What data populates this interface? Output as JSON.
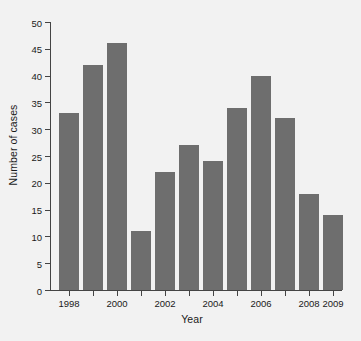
{
  "chart_data": {
    "type": "bar",
    "title": "",
    "xlabel": "Year",
    "ylabel": "Number of cases",
    "categories": [
      "1998",
      "1999",
      "2000",
      "2001",
      "2002",
      "2003",
      "2004",
      "2005",
      "2006",
      "2007",
      "2008",
      "2009"
    ],
    "values": [
      33,
      42,
      46,
      11,
      22,
      27,
      24,
      34,
      40,
      32,
      18,
      14
    ],
    "ylim": [
      0,
      50
    ],
    "yticks": [
      0,
      5,
      10,
      15,
      20,
      25,
      30,
      35,
      40,
      45,
      50
    ],
    "ytick_labels": [
      "0",
      "5",
      "10",
      "15",
      "20",
      "25",
      "30",
      "35",
      "40",
      "45",
      "50"
    ],
    "xtick_labels": [
      "1998",
      "",
      "2000",
      "",
      "2002",
      "",
      "2004",
      "",
      "2006",
      "",
      "2008",
      "2009"
    ],
    "grid": false,
    "legend": null,
    "bar_color": "#6e6e6e",
    "background_color": "#f2f2f2",
    "axis_color": "#444444"
  }
}
